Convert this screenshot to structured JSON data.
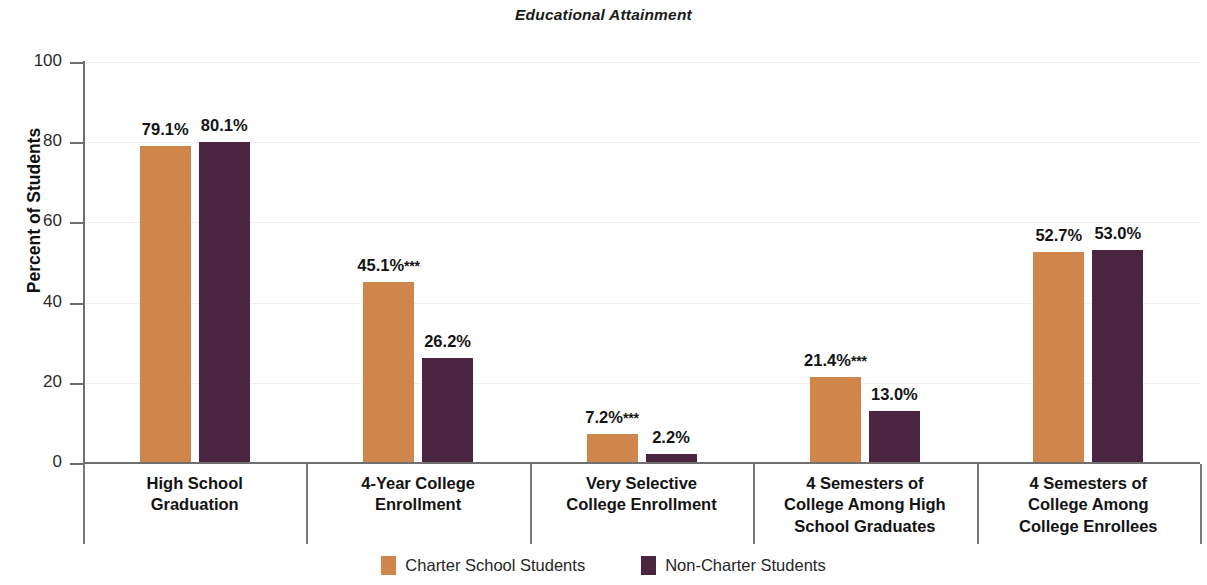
{
  "chart_data": {
    "type": "bar",
    "title": "Educational Attainment",
    "xlabel": "",
    "ylabel": "Percent of Students",
    "ylim": [
      0,
      100
    ],
    "yticks": [
      0,
      20,
      40,
      60,
      80,
      100
    ],
    "grid": true,
    "legend_position": "bottom",
    "categories": [
      "High School\nGraduation",
      "4-Year College\nEnrollment",
      "Very Selective\nCollege Enrollment",
      "4 Semesters of\nCollege Among High\nSchool Graduates",
      "4 Semesters of\nCollege Among\nCollege Enrollees"
    ],
    "series": [
      {
        "name": "Charter School Students",
        "color": "#D0854B",
        "values": [
          79.1,
          45.1,
          7.2,
          21.4,
          52.7
        ],
        "labels": [
          "79.1%",
          "45.1%***",
          "7.2%***",
          "21.4%***",
          "52.7%"
        ]
      },
      {
        "name": "Non-Charter Students",
        "color": "#4A2540",
        "values": [
          80.1,
          26.2,
          2.2,
          13.0,
          53.0
        ],
        "labels": [
          "80.1%",
          "26.2%",
          "2.2%",
          "13.0%",
          "53.0%"
        ]
      }
    ]
  },
  "chart": {
    "title": "Educational Attainment",
    "y_axis_title": "Percent of Students",
    "y_tick_labels": [
      "0",
      "20",
      "40",
      "60",
      "80",
      "100"
    ],
    "categories": [
      {
        "lines": [
          "High School",
          "Graduation"
        ]
      },
      {
        "lines": [
          "4-Year College",
          "Enrollment"
        ]
      },
      {
        "lines": [
          "Very Selective",
          "College Enrollment"
        ]
      },
      {
        "lines": [
          "4 Semesters of",
          "College Among High",
          "School Graduates"
        ]
      },
      {
        "lines": [
          "4 Semesters of",
          "College Among",
          "College Enrollees"
        ]
      }
    ],
    "bars": [
      {
        "series": 0,
        "group": 0,
        "value": 79.1,
        "label": "79.1%",
        "stars": ""
      },
      {
        "series": 1,
        "group": 0,
        "value": 80.1,
        "label": "80.1%",
        "stars": ""
      },
      {
        "series": 0,
        "group": 1,
        "value": 45.1,
        "label": "45.1%",
        "stars": "***"
      },
      {
        "series": 1,
        "group": 1,
        "value": 26.2,
        "label": "26.2%",
        "stars": ""
      },
      {
        "series": 0,
        "group": 2,
        "value": 7.2,
        "label": "7.2%",
        "stars": "***"
      },
      {
        "series": 1,
        "group": 2,
        "value": 2.2,
        "label": "2.2%",
        "stars": ""
      },
      {
        "series": 0,
        "group": 3,
        "value": 21.4,
        "label": "21.4%",
        "stars": "***"
      },
      {
        "series": 1,
        "group": 3,
        "value": 13.0,
        "label": "13.0%",
        "stars": ""
      },
      {
        "series": 0,
        "group": 4,
        "value": 52.7,
        "label": "52.7%",
        "stars": ""
      },
      {
        "series": 1,
        "group": 4,
        "value": 53.0,
        "label": "53.0%",
        "stars": ""
      }
    ],
    "legend": [
      {
        "label": "Charter School Students",
        "color": "#D0854B"
      },
      {
        "label": "Non-Charter Students",
        "color": "#4A2540"
      }
    ]
  }
}
